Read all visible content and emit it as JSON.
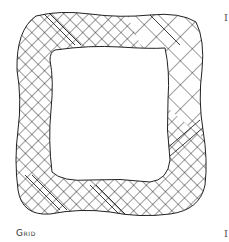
{
  "figure": {
    "caption": "Grid",
    "edge_glyph_top": "I",
    "edge_glyph_bottom": "I",
    "colors": {
      "stroke": "#222222",
      "background": "#ffffff",
      "caption": "#333333"
    },
    "pattern": {
      "fine_grid": "crosshatch",
      "coarse_grid": "crosshatch-large",
      "bands": "diagonal-stripes"
    }
  }
}
